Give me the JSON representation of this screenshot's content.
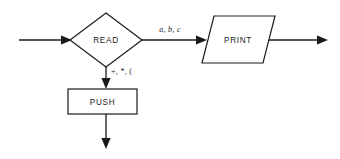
{
  "diagram": {
    "type": "flowchart",
    "background_color": "#ffffff",
    "line_color": "#1a1a1a",
    "nodes": [
      {
        "id": "read",
        "label": "READ",
        "shape": "diamond"
      },
      {
        "id": "print",
        "label": "PRINT",
        "shape": "parallelogram"
      },
      {
        "id": "push",
        "label": "PUSH",
        "shape": "rectangle"
      }
    ],
    "edge_labels": {
      "read_to_print": "a, b, c",
      "read_to_push": "+, *, ("
    }
  }
}
